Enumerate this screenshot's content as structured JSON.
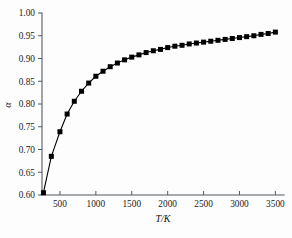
{
  "chart_data": {
    "type": "line",
    "title": "",
    "subtitle": "",
    "xlabel": "T/K",
    "ylabel": "α",
    "xlim": [
      250,
      3620
    ],
    "ylim": [
      0.6,
      1.0
    ],
    "xticks": [
      500,
      1000,
      1500,
      2000,
      2500,
      3000,
      3500
    ],
    "xtick_labels": [
      "500",
      "1000",
      "1500",
      "2000",
      "2500",
      "3000",
      "3500"
    ],
    "yticks": [
      0.6,
      0.65,
      0.7,
      0.75,
      0.8,
      0.85,
      0.9,
      0.95,
      1.0
    ],
    "ytick_labels": [
      "0.60",
      "0.65",
      "0.70",
      "0.75",
      "0.80",
      "0.85",
      "0.90",
      "0.95",
      "1.00"
    ],
    "grid": false,
    "legend": null,
    "legend_position": "none",
    "marker": "filled-square",
    "marker_color": "#000000",
    "line_color": "#000000",
    "axis_color": "#555b60",
    "annotations": [],
    "series": [
      {
        "name": "alpha",
        "x": [
          270,
          380,
          500,
          600,
          700,
          800,
          900,
          1000,
          1100,
          1200,
          1300,
          1400,
          1500,
          1600,
          1700,
          1800,
          1900,
          2000,
          2100,
          2200,
          2300,
          2400,
          2500,
          2600,
          2700,
          2800,
          2900,
          3000,
          3100,
          3200,
          3300,
          3400,
          3500
        ],
        "values": [
          0.605,
          0.685,
          0.739,
          0.778,
          0.806,
          0.828,
          0.846,
          0.861,
          0.872,
          0.882,
          0.89,
          0.897,
          0.903,
          0.908,
          0.913,
          0.917,
          0.92,
          0.924,
          0.927,
          0.929,
          0.932,
          0.934,
          0.936,
          0.938,
          0.94,
          0.942,
          0.944,
          0.946,
          0.948,
          0.95,
          0.953,
          0.955,
          0.958
        ]
      }
    ]
  },
  "figure": {
    "background_color": "#fdfdfd",
    "plot_left_px": 42,
    "plot_right_px": 284,
    "plot_top_px": 13,
    "plot_bottom_px": 195
  }
}
